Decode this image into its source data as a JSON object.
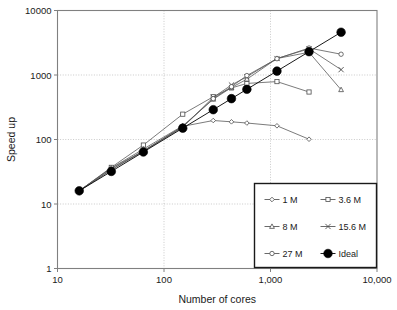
{
  "chart_data": {
    "type": "line",
    "title": "",
    "xlabel": "Number of cores",
    "ylabel": "Speed up",
    "xscale": "log",
    "yscale": "log",
    "xlim": [
      10,
      10000
    ],
    "ylim": [
      1,
      10000
    ],
    "xticks": [
      "10",
      "100",
      "1,000",
      "10,000"
    ],
    "xtick_values": [
      10,
      100,
      1000,
      10000
    ],
    "yticks": [
      "1",
      "10",
      "100",
      "1000",
      "10000"
    ],
    "ytick_values": [
      1,
      10,
      100,
      1000,
      10000
    ],
    "grid": true,
    "legend_position": "lower-right",
    "series": [
      {
        "name": "1 M",
        "marker": "diamond",
        "x": [
          16,
          32,
          64,
          150,
          290,
          430,
          600,
          1150,
          2300
        ],
        "y": [
          16,
          36,
          66,
          160,
          197,
          188,
          180,
          163,
          101
        ]
      },
      {
        "name": "3.6 M",
        "marker": "square",
        "x": [
          16,
          32,
          64,
          150,
          290,
          430,
          600,
          1150,
          2300
        ],
        "y": [
          16,
          37,
          82,
          247,
          460,
          630,
          740,
          790,
          545
        ]
      },
      {
        "name": "8 M",
        "marker": "triangle",
        "x": [
          16,
          32,
          64,
          150,
          290,
          430,
          600,
          1150,
          2300,
          4600
        ],
        "y": [
          16,
          36,
          71,
          163,
          420,
          640,
          860,
          1800,
          2250,
          590
        ]
      },
      {
        "name": "15.6 M",
        "marker": "cross",
        "x": [
          16,
          32,
          64,
          150,
          290,
          430,
          600,
          1150,
          2300,
          4600
        ],
        "y": [
          16,
          34,
          66,
          155,
          450,
          700,
          940,
          1800,
          2550,
          1210
        ]
      },
      {
        "name": "27 M",
        "marker": "circle-open",
        "x": [
          16,
          32,
          64,
          150,
          290,
          430,
          600,
          1150,
          2300,
          4600
        ],
        "y": [
          16,
          34,
          67,
          158,
          430,
          660,
          980,
          1790,
          2620,
          2100
        ]
      },
      {
        "name": "Ideal",
        "marker": "circle-filled",
        "x": [
          16,
          32,
          64,
          150,
          290,
          430,
          600,
          1150,
          2300,
          4600
        ],
        "y": [
          16,
          32,
          64,
          150,
          290,
          430,
          600,
          1150,
          2300,
          4600
        ]
      }
    ]
  },
  "legend": {
    "entries": [
      {
        "label": "1 M",
        "marker": "diamond"
      },
      {
        "label": "3.6 M",
        "marker": "square"
      },
      {
        "label": "8 M",
        "marker": "triangle"
      },
      {
        "label": "15.6 M",
        "marker": "cross"
      },
      {
        "label": "27 M",
        "marker": "circle-open"
      },
      {
        "label": "Ideal",
        "marker": "circle-filled"
      }
    ]
  },
  "colors": {
    "line": "#595959",
    "marker_stroke": "#4d4d4d",
    "ideal": "#000000",
    "axis": "#808080",
    "grid": "#b3b3b3",
    "text": "#1a1a1a",
    "background": "#ffffff"
  }
}
